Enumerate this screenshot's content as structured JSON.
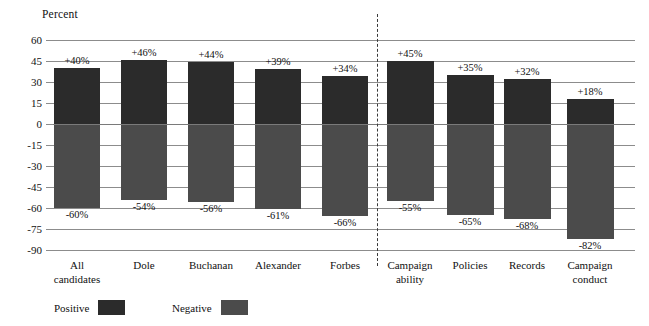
{
  "chart_data": {
    "type": "bar",
    "title": "",
    "ylabel": "Percent",
    "xlabel": "",
    "ylim": [
      -90,
      60
    ],
    "yticks": [
      60,
      45,
      30,
      15,
      0,
      -15,
      -30,
      -45,
      -60,
      -75,
      -90
    ],
    "ytick_labels": [
      "60",
      "45",
      "30",
      "15",
      "0",
      "-15",
      "-30",
      "-45",
      "-60",
      "-75",
      "-90"
    ],
    "grid": true,
    "legend_position": "bottom-left",
    "categories": [
      "All candidates",
      "Dole",
      "Buchanan",
      "Alexander",
      "Forbes",
      "Campaign ability",
      "Policies",
      "Records",
      "Campaign conduct"
    ],
    "series": [
      {
        "name": "Positive",
        "color": "#2b2b2b",
        "values": [
          40,
          46,
          44,
          39,
          34,
          45,
          35,
          32,
          18
        ],
        "labels": [
          "+40%",
          "+46%",
          "+44%",
          "+39%",
          "+34%",
          "+45%",
          "+35%",
          "+32%",
          "+18%"
        ]
      },
      {
        "name": "Negative",
        "color": "#4b4b4b",
        "values": [
          -60,
          -54,
          -56,
          -61,
          -66,
          -55,
          -65,
          -68,
          -82
        ],
        "labels": [
          "-60%",
          "-54%",
          "-56%",
          "-61%",
          "-66%",
          "-55%",
          "-65%",
          "-68%",
          "-82%"
        ]
      }
    ],
    "annotations": [
      {
        "type": "vertical-dashed-divider",
        "after_category_index": 4
      }
    ]
  },
  "categories_display": [
    {
      "line1": "All",
      "line2": "candidates"
    },
    {
      "line1": "Dole",
      "line2": ""
    },
    {
      "line1": "Buchanan",
      "line2": ""
    },
    {
      "line1": "Alexander",
      "line2": ""
    },
    {
      "line1": "Forbes",
      "line2": ""
    },
    {
      "line1": "Campaign",
      "line2": "ability"
    },
    {
      "line1": "Policies",
      "line2": ""
    },
    {
      "line1": "Records",
      "line2": ""
    },
    {
      "line1": "Campaign",
      "line2": "conduct"
    }
  ],
  "legend": {
    "positive_label": "Positive",
    "negative_label": "Negative"
  },
  "colors": {
    "positive": "#2b2b2b",
    "negative": "#4b4b4b",
    "gridline": "#8c8c8c",
    "text": "#111111",
    "background": "#ffffff"
  }
}
